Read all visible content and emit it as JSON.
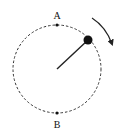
{
  "diagram": {
    "circle": {
      "cx": 57,
      "cy": 69,
      "r": 44,
      "style": "dashed"
    },
    "points": [
      {
        "label": "A",
        "x": 57,
        "y": 25,
        "label_x": 57,
        "label_y": 18
      },
      {
        "label": "B",
        "x": 57,
        "y": 113,
        "label_x": 57,
        "label_y": 128
      }
    ],
    "ball": {
      "x": 88,
      "y": 40,
      "r": 4.5
    },
    "rod": {
      "x1": 57,
      "y1": 69,
      "x2": 88,
      "y2": 40
    },
    "rotation": "clockwise",
    "colors": {
      "stroke": "#222222",
      "background": "#ffffff"
    }
  }
}
